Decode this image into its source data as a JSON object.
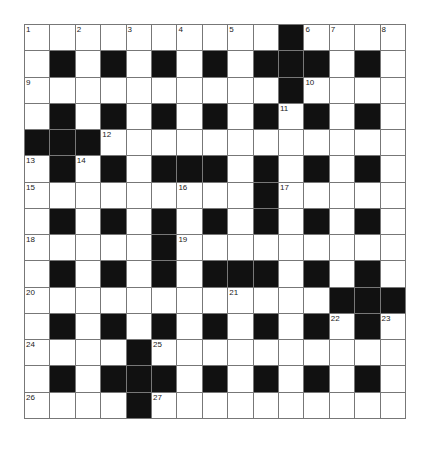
{
  "puzzle": {
    "rows": 15,
    "cols": 15,
    "colors": {
      "black": "#111111",
      "white": "#ffffff",
      "line": "#777777"
    },
    "grid": [
      "..........#....",
      ".#.#.#.#.###.#.",
      "..........#....",
      ".#.#.#.#.#.#.#.",
      "###............",
      ".#.#.###.#.#.#.",
      ".........#.....",
      ".#.#.#.#.#.#.#.",
      ".....#.........",
      ".#.#.#.###.#.#.",
      "............###",
      ".#.#.#.#.#.#.#.",
      "....#..........",
      ".#.###.#.#.#.#.",
      "....#.........."
    ],
    "numbers": [
      {
        "r": 0,
        "c": 0,
        "n": "1"
      },
      {
        "r": 0,
        "c": 2,
        "n": "2"
      },
      {
        "r": 0,
        "c": 4,
        "n": "3"
      },
      {
        "r": 0,
        "c": 6,
        "n": "4"
      },
      {
        "r": 0,
        "c": 8,
        "n": "5"
      },
      {
        "r": 0,
        "c": 11,
        "n": "6"
      },
      {
        "r": 0,
        "c": 12,
        "n": "7"
      },
      {
        "r": 0,
        "c": 14,
        "n": "8"
      },
      {
        "r": 2,
        "c": 0,
        "n": "9"
      },
      {
        "r": 2,
        "c": 11,
        "n": "10"
      },
      {
        "r": 3,
        "c": 10,
        "n": "11"
      },
      {
        "r": 4,
        "c": 3,
        "n": "12"
      },
      {
        "r": 5,
        "c": 0,
        "n": "13"
      },
      {
        "r": 5,
        "c": 2,
        "n": "14"
      },
      {
        "r": 6,
        "c": 0,
        "n": "15"
      },
      {
        "r": 6,
        "c": 6,
        "n": "16"
      },
      {
        "r": 6,
        "c": 10,
        "n": "17"
      },
      {
        "r": 8,
        "c": 0,
        "n": "18"
      },
      {
        "r": 8,
        "c": 6,
        "n": "19"
      },
      {
        "r": 10,
        "c": 0,
        "n": "20"
      },
      {
        "r": 10,
        "c": 8,
        "n": "21"
      },
      {
        "r": 11,
        "c": 12,
        "n": "22"
      },
      {
        "r": 11,
        "c": 14,
        "n": "23"
      },
      {
        "r": 12,
        "c": 0,
        "n": "24"
      },
      {
        "r": 12,
        "c": 5,
        "n": "25"
      },
      {
        "r": 14,
        "c": 0,
        "n": "26"
      },
      {
        "r": 14,
        "c": 5,
        "n": "27"
      }
    ]
  }
}
